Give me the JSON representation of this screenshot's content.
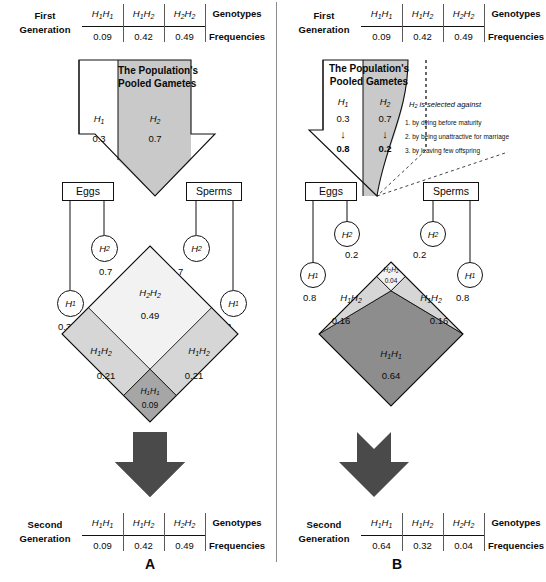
{
  "figure": {
    "panel_a_letter": "A",
    "panel_b_letter": "B",
    "genotype_headers": [
      "H1H1",
      "H1H2",
      "H2H2"
    ],
    "row_label_genotypes": "Genotypes",
    "row_label_frequencies": "Frequencies"
  },
  "panel_a": {
    "first_gen": {
      "label_line1": "First",
      "label_line2": "Generation",
      "genotypes": [
        "H1H1",
        "H1H2",
        "H2H2"
      ],
      "frequencies": [
        "0.09",
        "0.42",
        "0.49"
      ],
      "col_header": "Genotypes",
      "col_header2": "Frequencies"
    },
    "pool": {
      "title_line1": "The Population's",
      "title_line2": "Pooled Gametes",
      "allele1_label": "H1",
      "allele1_freq": "0.3",
      "allele2_label": "H2",
      "allele2_freq": "0.7"
    },
    "gametes": {
      "eggs_label": "Eggs",
      "sperms_label": "Sperms",
      "egg_h2": "H2",
      "egg_h2_freq": "0.7",
      "egg_h1": "H1",
      "egg_h1_freq": "0.3",
      "sperm_h2": "H2",
      "sperm_h2_freq": "0.7",
      "sperm_h1": "H1",
      "sperm_h1_freq": "0.3"
    },
    "punnett": {
      "top_genotype": "H2H2",
      "top_value": "0.49",
      "left_genotype": "H1H2",
      "left_value": "0.21",
      "right_genotype": "H1H2",
      "right_value": "0.21",
      "bottom_genotype": "H1H1",
      "bottom_value": "0.09"
    },
    "second_gen": {
      "label_line1": "Second",
      "label_line2": "Generation",
      "genotypes": [
        "H1H1",
        "H1H2",
        "H2H2"
      ],
      "frequencies": [
        "0.09",
        "0.42",
        "0.49"
      ]
    }
  },
  "panel_b": {
    "first_gen": {
      "label_line1": "First",
      "label_line2": "Generation",
      "genotypes": [
        "H1H1",
        "H1H2",
        "H2H2"
      ],
      "frequencies": [
        "0.09",
        "0.42",
        "0.49"
      ]
    },
    "pool": {
      "title_line1": "The Population's",
      "title_line2": "Pooled Gametes",
      "allele1_label": "H1",
      "allele1_freq": "0.3",
      "allele1_freq_after": "0.8",
      "allele2_label": "H2",
      "allele2_freq": "0.7",
      "allele2_freq_after": "0.2"
    },
    "selection": {
      "heading": "H2 is selected against",
      "item1": "1. by dying before maturity",
      "item2": "2. by being unattractive for marriage",
      "item3": "3. by leaving few offspring"
    },
    "gametes": {
      "eggs_label": "Eggs",
      "sperms_label": "Sperms",
      "egg_h2": "H2",
      "egg_h2_freq": "0.2",
      "egg_h1": "H1",
      "egg_h1_freq": "0.8",
      "sperm_h2": "H2",
      "sperm_h2_freq": "0.2",
      "sperm_h1": "H1",
      "sperm_h1_freq": "0.8"
    },
    "punnett": {
      "top_genotype": "H2H2",
      "top_value": "0.04",
      "left_genotype": "H1H2",
      "left_value": "0.16",
      "right_genotype": "H1H2",
      "right_value": "0.16",
      "bottom_genotype": "H1H1",
      "bottom_value": "0.64"
    },
    "second_gen": {
      "label_line1": "Second",
      "label_line2": "Generation",
      "genotypes": [
        "H1H1",
        "H1H2",
        "H2H2"
      ],
      "frequencies": [
        "0.64",
        "0.32",
        "0.04"
      ]
    }
  },
  "colors": {
    "light_fill": "#f2f2f2",
    "mid_light_fill": "#d6d6d6",
    "mid_fill": "#a6a6a6",
    "dark_fill": "#8d8d8d",
    "arrow_dark": "#4a4a4a",
    "pool_gray": "#c9c9c9",
    "stroke": "#111111"
  }
}
